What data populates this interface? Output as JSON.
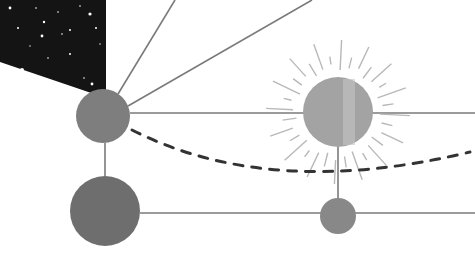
{
  "scene": {
    "width": 475,
    "height": 265,
    "background": "#ffffff",
    "colors": {
      "sky": "#141414",
      "line": "#7a7a7a",
      "ray": "#b8b8b8",
      "dash": "#333333",
      "body_a": "#7e7e7e",
      "body_b": "#6e6e6e",
      "sun": "#a3a3a3",
      "sun_highlight": "#c4c4c4",
      "small_body": "#888888"
    },
    "sky_polygon": [
      [
        0,
        0
      ],
      [
        106,
        0
      ],
      [
        106,
        98
      ],
      [
        0,
        62
      ]
    ],
    "stars": [
      [
        10,
        8,
        1.4
      ],
      [
        18,
        28,
        1
      ],
      [
        44,
        22,
        1.2
      ],
      [
        58,
        12,
        0.8
      ],
      [
        70,
        30,
        1
      ],
      [
        90,
        14,
        1.6
      ],
      [
        96,
        28,
        1
      ],
      [
        42,
        36,
        1.4
      ],
      [
        62,
        34,
        0.8
      ],
      [
        22,
        70,
        2
      ],
      [
        48,
        58,
        0.8
      ],
      [
        70,
        54,
        1
      ],
      [
        84,
        78,
        0.8
      ],
      [
        92,
        84,
        1.4
      ],
      [
        36,
        8,
        0.8
      ],
      [
        80,
        6,
        0.8
      ],
      [
        30,
        46,
        0.7
      ],
      [
        100,
        44,
        0.7
      ]
    ],
    "bodies": [
      {
        "name": "planet-upper-left",
        "cx": 103,
        "cy": 116,
        "rx": 27,
        "ry": 27,
        "fill": "body_a"
      },
      {
        "name": "planet-lower-left",
        "cx": 105,
        "cy": 211,
        "rx": 35,
        "ry": 35,
        "fill": "body_b"
      },
      {
        "name": "sun",
        "cx": 338,
        "cy": 112,
        "rx": 35,
        "ry": 35,
        "fill": "sun"
      },
      {
        "name": "small-planet",
        "cx": 338,
        "cy": 216,
        "rx": 18,
        "ry": 18,
        "fill": "small_body"
      }
    ],
    "lines": [
      [
        118,
        94,
        175,
        0
      ],
      [
        128,
        106,
        312,
        0
      ],
      [
        130,
        113,
        475,
        113
      ],
      [
        105,
        143,
        105,
        176
      ],
      [
        140,
        213,
        475,
        213
      ],
      [
        338,
        147,
        338,
        198
      ]
    ],
    "dashed_curve": "M 132 130 Q 270 200 470 152",
    "sun_rays": {
      "count": 32,
      "inner": 42,
      "outer_short": 56,
      "outer_long": 72
    }
  }
}
